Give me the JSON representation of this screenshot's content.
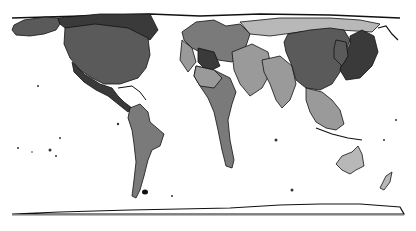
{
  "map": {
    "type": "cartogram",
    "projection": "equirectangular-like world cartogram",
    "palette": {
      "background": "#ffffff",
      "outline": "#111111",
      "dark": "#3a3a3a",
      "medium_dark": "#5a5a5a",
      "medium": "#7a7a7a",
      "light": "#9a9a9a",
      "lighter": "#b8b8b8"
    },
    "regions": [
      {
        "name": "Alaska",
        "shade": "medium_dark"
      },
      {
        "name": "Canada",
        "shade": "dark"
      },
      {
        "name": "United States",
        "shade": "medium_dark"
      },
      {
        "name": "Mexico / Central America",
        "shade": "dark"
      },
      {
        "name": "South America",
        "shade": "medium"
      },
      {
        "name": "Europe",
        "shade": "medium"
      },
      {
        "name": "Russia",
        "shade": "lighter"
      },
      {
        "name": "Middle East",
        "shade": "light"
      },
      {
        "name": "Africa",
        "shade": "medium"
      },
      {
        "name": "India",
        "shade": "light"
      },
      {
        "name": "China",
        "shade": "medium_dark"
      },
      {
        "name": "Japan / Korea",
        "shade": "dark"
      },
      {
        "name": "Southeast Asia",
        "shade": "light"
      },
      {
        "name": "Australia",
        "shade": "lighter"
      },
      {
        "name": "New Zealand",
        "shade": "lighter"
      },
      {
        "name": "Antarctica",
        "shade": "outline"
      }
    ]
  }
}
